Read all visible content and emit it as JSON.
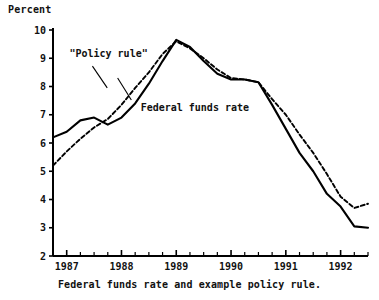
{
  "chart_data": {
    "type": "line",
    "title": "",
    "caption": "Federal funds rate and example policy rule.",
    "ylabel": "Percent",
    "xlabel": "",
    "ylim": [
      2,
      10
    ],
    "xlim": [
      1986.75,
      1992.5
    ],
    "grid": false,
    "legend_position": "inline-annotations",
    "y_ticks": [
      10,
      9,
      8,
      7,
      6,
      5,
      4,
      3,
      2
    ],
    "y_tick_labels": [
      "10",
      "9",
      "8",
      "7",
      "6",
      "5",
      "4",
      "3",
      "2"
    ],
    "x_ticks": [
      1987,
      1988,
      1989,
      1990,
      1991,
      1992
    ],
    "x_tick_labels": [
      "1987",
      "1988",
      "1989",
      "1990",
      "1991",
      "1992"
    ],
    "x_minor_tick_interval": 0.25,
    "annotations": [
      {
        "name": "policy-rule-label",
        "text": "\"Policy rule\"",
        "x": 1987.05,
        "y": 9.05
      },
      {
        "name": "federal-funds-rate-label",
        "text": "Federal funds rate",
        "x": 1988.35,
        "y": 7.15
      }
    ],
    "series": [
      {
        "name": "Federal funds rate",
        "style": "solid",
        "color": "#000000",
        "x": [
          1986.75,
          1987.0,
          1987.25,
          1987.5,
          1987.75,
          1988.0,
          1988.25,
          1988.5,
          1988.75,
          1989.0,
          1989.25,
          1989.5,
          1989.75,
          1990.0,
          1990.25,
          1990.5,
          1990.75,
          1991.0,
          1991.25,
          1991.5,
          1991.75,
          1992.0,
          1992.25,
          1992.5
        ],
        "values": [
          6.2,
          6.4,
          6.8,
          6.9,
          6.65,
          6.9,
          7.4,
          8.1,
          8.9,
          9.65,
          9.4,
          8.9,
          8.45,
          8.25,
          8.25,
          8.15,
          7.35,
          6.5,
          5.65,
          5.0,
          4.2,
          3.75,
          3.05,
          3.0
        ]
      },
      {
        "name": "\"Policy rule\"",
        "style": "dashed",
        "color": "#000000",
        "x": [
          1986.75,
          1987.0,
          1987.25,
          1987.5,
          1987.75,
          1988.0,
          1988.25,
          1988.5,
          1988.75,
          1989.0,
          1989.25,
          1989.5,
          1989.75,
          1990.0,
          1990.25,
          1990.5,
          1990.75,
          1991.0,
          1991.25,
          1991.5,
          1991.75,
          1992.0,
          1992.25,
          1992.5
        ],
        "values": [
          5.2,
          5.7,
          6.15,
          6.55,
          6.85,
          7.35,
          7.95,
          8.5,
          9.15,
          9.6,
          9.35,
          9.0,
          8.6,
          8.3,
          8.25,
          8.15,
          7.55,
          7.0,
          6.3,
          5.65,
          4.9,
          4.1,
          3.7,
          3.85
        ]
      }
    ]
  },
  "labels": {
    "y_axis_unit": "Percent",
    "caption": "Federal funds rate and example policy rule."
  }
}
